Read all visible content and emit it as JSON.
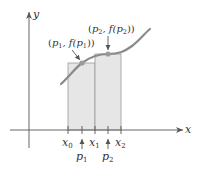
{
  "diagram": {
    "axes": {
      "x_label": "x",
      "y_label": "y"
    },
    "partition": {
      "x0": {
        "name": "x",
        "sub": "0"
      },
      "x1": {
        "name": "x",
        "sub": "1"
      },
      "x2": {
        "name": "x",
        "sub": "2"
      }
    },
    "sample_points": {
      "p1": {
        "name": "p",
        "sub": "1"
      },
      "p2": {
        "name": "p",
        "sub": "2"
      }
    },
    "callouts": {
      "point1": {
        "open": "(",
        "p": "p",
        "sub": "1",
        "mid": ", f(",
        "p2": "p",
        "sub2": "1",
        "close": "))"
      },
      "point2": {
        "open": "(",
        "p": "p",
        "sub": "2",
        "mid": ", f(",
        "p2": "p",
        "sub2": "2",
        "close": "))"
      }
    },
    "colors": {
      "axis": "#555555",
      "curve": "#8a8a8a",
      "rect_fill": "#e6e6e6",
      "rect_stroke": "#9a9a9a",
      "point": "#9a9a9a",
      "text": "#333333"
    }
  }
}
